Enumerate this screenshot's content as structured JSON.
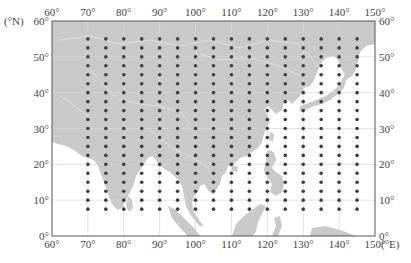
{
  "map": {
    "type": "grid-point map",
    "frame": {
      "lon_min": 60,
      "lon_max": 150,
      "lat_min": 0,
      "lat_max": 60
    },
    "x_unit_label": "(°E)",
    "y_unit_label": "(°N)",
    "x_ticks": [
      "60°",
      "70°",
      "80°",
      "90°",
      "100°",
      "110°",
      "120°",
      "130°",
      "140°",
      "150°"
    ],
    "y_ticks": [
      "0°",
      "10°",
      "20°",
      "30°",
      "40°",
      "50°",
      "60°"
    ],
    "gridlines_every_deg": 10,
    "colors": {
      "land": "#c9c9c9",
      "ocean": "#ffffff",
      "border": "#e6e6e6",
      "gridline": "#d9d9d9",
      "frame": "#555555",
      "dot": "#3f3f3f"
    },
    "grid_points": {
      "lon_start": 70,
      "lon_end": 145,
      "lon_step": 5,
      "lat_start": 55,
      "lat_end": 7.5,
      "lat_step": 2.5,
      "columns": 16,
      "rows": 20
    }
  }
}
